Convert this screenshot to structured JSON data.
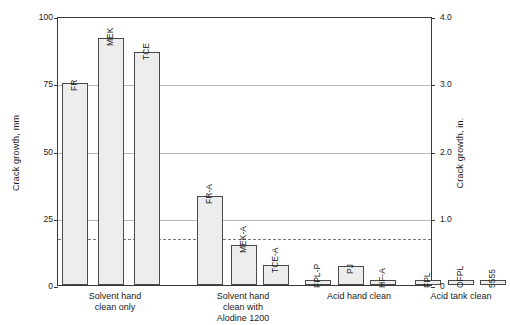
{
  "chart_data": {
    "type": "bar",
    "title": "",
    "xlabel": "",
    "ylabel": "Crack growth, mm",
    "ylabel_secondary": "Crack growth, in.",
    "ylim": [
      0,
      100
    ],
    "ylim_secondary": [
      0,
      4.0
    ],
    "grid": true,
    "legend": "none",
    "categories": [
      "FR",
      "MEK",
      "TCE",
      "FR-A",
      "MEK-A",
      "TCE-A",
      "FPL-P",
      "PJ",
      "HF-A",
      "FPL",
      "OFPL",
      "5555"
    ],
    "values": [
      75,
      92,
      86.5,
      33,
      15,
      7.5,
      2,
      7,
      2,
      2,
      2,
      2
    ],
    "series": [
      {
        "name": "Crack growth",
        "values": [
          75,
          92,
          86.5,
          33,
          15,
          7.5,
          2,
          7,
          2,
          2,
          2,
          2
        ]
      }
    ],
    "annotations": [
      {
        "type": "threshold-line",
        "style": "dashed",
        "value": 18
      }
    ],
    "groups": [
      {
        "caption": "Solvent hand\nclean only",
        "bars": [
          {
            "label": "FR",
            "value": 75
          },
          {
            "label": "MEK",
            "value": 92
          },
          {
            "label": "TCE",
            "value": 86.5
          }
        ]
      },
      {
        "caption": "Solvent hand\nclean with\nAlodine 1200",
        "bars": [
          {
            "label": "FR-A",
            "value": 33
          },
          {
            "label": "MEK-A",
            "value": 15
          },
          {
            "label": "TCE-A",
            "value": 7.5
          }
        ]
      },
      {
        "caption": "Acid hand clean",
        "bars": [
          {
            "label": "FPL-P",
            "value": 2
          },
          {
            "label": "PJ",
            "value": 7
          },
          {
            "label": "HF-A",
            "value": 2
          }
        ]
      },
      {
        "caption": "Acid tank clean",
        "bars": [
          {
            "label": "FPL",
            "value": 2
          },
          {
            "label": "OFPL",
            "value": 2
          },
          {
            "label": "5555",
            "value": 2
          }
        ]
      }
    ],
    "yticks_left": [
      "0",
      "25",
      "50",
      "75",
      "100"
    ],
    "ytick_values_left": [
      0,
      25,
      50,
      75,
      100
    ],
    "yticks_right": [
      "0",
      "1.0",
      "2.0",
      "3.0",
      "4.0"
    ],
    "ytick_values_right": [
      0,
      1.0,
      2.0,
      3.0,
      4.0
    ],
    "colors": {
      "bar_fill": "#ededed",
      "bar_border": "#4a4a4a",
      "gridline": "#b9b9b9",
      "frame": "#3a3a3a",
      "threshold": "#7a7a7a",
      "text": "#1a1a1a",
      "background": "#ffffff"
    }
  }
}
